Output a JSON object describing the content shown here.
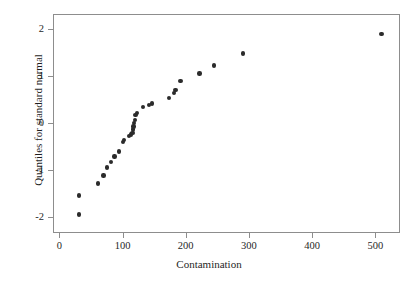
{
  "chart_data": {
    "type": "scatter",
    "title": "",
    "xlabel": "Contamination",
    "ylabel": "Quantiles for standard normal",
    "xlim": [
      -10,
      539
    ],
    "ylim": [
      -2.35,
      2.33
    ],
    "xticks": [
      0,
      100,
      200,
      300,
      400,
      500
    ],
    "xticklabels": [
      "0",
      "100",
      "200",
      "300",
      "400",
      "500"
    ],
    "yticks": [
      -2,
      -1,
      0,
      1,
      2
    ],
    "yticklabels": [
      "-2",
      "-1",
      "0",
      "1",
      "2"
    ],
    "grid": false,
    "legend": null,
    "marker": "filled-circle",
    "marker_color": "#2b2b2b",
    "marker_size": 4.4,
    "frame_color": "#8d8d8d",
    "background": "#ffffff",
    "n_points": 30,
    "x": [
      30,
      30,
      60,
      68,
      74,
      80,
      86,
      93,
      99,
      101,
      109,
      112,
      114,
      115,
      116,
      117,
      118,
      119,
      121,
      131,
      140,
      145,
      172,
      180,
      182,
      190,
      220,
      243,
      289,
      508
    ],
    "y": [
      -1.93,
      -1.53,
      -1.27,
      -1.1,
      -0.93,
      -0.81,
      -0.69,
      -0.59,
      -0.38,
      -0.34,
      -0.25,
      -0.22,
      -0.19,
      -0.12,
      -0.05,
      0.02,
      0.08,
      0.19,
      0.23,
      0.36,
      0.41,
      0.44,
      0.56,
      0.66,
      0.73,
      0.92,
      1.08,
      1.25,
      1.51,
      1.92
    ],
    "points": [
      {
        "x": 30,
        "y": -1.93
      },
      {
        "x": 30,
        "y": -1.53
      },
      {
        "x": 60,
        "y": -1.27
      },
      {
        "x": 68,
        "y": -1.1
      },
      {
        "x": 74,
        "y": -0.93
      },
      {
        "x": 80,
        "y": -0.81
      },
      {
        "x": 86,
        "y": -0.69
      },
      {
        "x": 93,
        "y": -0.59
      },
      {
        "x": 99,
        "y": -0.38
      },
      {
        "x": 101,
        "y": -0.34
      },
      {
        "x": 109,
        "y": -0.25
      },
      {
        "x": 112,
        "y": -0.22
      },
      {
        "x": 114,
        "y": -0.19
      },
      {
        "x": 115,
        "y": -0.12
      },
      {
        "x": 116,
        "y": -0.05
      },
      {
        "x": 117,
        "y": 0.02
      },
      {
        "x": 118,
        "y": 0.08
      },
      {
        "x": 119,
        "y": 0.19
      },
      {
        "x": 121,
        "y": 0.23
      },
      {
        "x": 131,
        "y": 0.36
      },
      {
        "x": 140,
        "y": 0.41
      },
      {
        "x": 145,
        "y": 0.44
      },
      {
        "x": 172,
        "y": 0.56
      },
      {
        "x": 180,
        "y": 0.66
      },
      {
        "x": 182,
        "y": 0.73
      },
      {
        "x": 190,
        "y": 0.92
      },
      {
        "x": 220,
        "y": 1.08
      },
      {
        "x": 243,
        "y": 1.25
      },
      {
        "x": 289,
        "y": 1.51
      },
      {
        "x": 508,
        "y": 1.92
      }
    ]
  }
}
